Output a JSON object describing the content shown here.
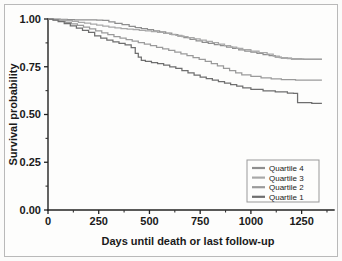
{
  "figure": {
    "background_color": "#fdfdfc",
    "frame_color": "#b9b9b9"
  },
  "chart_data": {
    "type": "line",
    "title": "",
    "subtitle": "",
    "xlabel": "Days until death or last follow-up",
    "ylabel": "Survival probability",
    "xlim": [
      0,
      1380
    ],
    "ylim": [
      0.0,
      1.0
    ],
    "xticks": [
      0,
      250,
      500,
      750,
      1000,
      1250
    ],
    "xtick_labels": [
      "0",
      "250",
      "500",
      "750",
      "1000",
      "1250"
    ],
    "xminor_ticks": [
      125,
      375,
      625,
      875,
      1125,
      1375
    ],
    "yticks": [
      0.0,
      0.25,
      0.5,
      0.75,
      1.0
    ],
    "ytick_labels": [
      "0.00",
      "0.25",
      "0.50",
      "0.75",
      "1.00"
    ],
    "yminor_ticks": [
      0.125,
      0.375,
      0.625,
      0.875
    ],
    "grid": false,
    "legend_position": "lower right",
    "legend_entries": [
      "Quartile 4",
      "Quartile 3",
      "Quartile 2",
      "Quartile 1"
    ],
    "series": [
      {
        "name": "Quartile 4",
        "color": "#8e8e8e",
        "step": "post",
        "x": [
          0,
          30,
          60,
          95,
          130,
          170,
          200,
          240,
          270,
          300,
          330,
          365,
          400,
          430,
          460,
          490,
          520,
          550,
          580,
          610,
          640,
          670,
          700,
          730,
          760,
          790,
          820,
          850,
          880,
          910,
          940,
          970,
          1000,
          1030,
          1060,
          1090,
          1120,
          1150,
          1200,
          1260,
          1350
        ],
        "y": [
          1.0,
          1.0,
          0.998,
          0.997,
          0.996,
          0.995,
          0.995,
          0.994,
          0.993,
          0.985,
          0.977,
          0.97,
          0.962,
          0.955,
          0.95,
          0.944,
          0.938,
          0.932,
          0.926,
          0.918,
          0.91,
          0.902,
          0.894,
          0.886,
          0.878,
          0.872,
          0.866,
          0.86,
          0.853,
          0.846,
          0.839,
          0.832,
          0.826,
          0.82,
          0.814,
          0.808,
          0.8,
          0.795,
          0.79,
          0.788,
          0.788
        ]
      },
      {
        "name": "Quartile 3",
        "color": "#a8a8a8",
        "step": "post",
        "x": [
          0,
          30,
          60,
          90,
          120,
          150,
          180,
          210,
          240,
          270,
          300,
          330,
          360,
          390,
          420,
          450,
          480,
          510,
          540,
          570,
          600,
          630,
          660,
          690,
          720,
          750,
          780,
          810,
          840,
          870,
          900,
          930,
          960,
          1000,
          1040,
          1080,
          1110,
          1140,
          1180,
          1250,
          1350
        ],
        "y": [
          1.0,
          0.998,
          0.996,
          0.992,
          0.988,
          0.983,
          0.978,
          0.973,
          0.968,
          0.963,
          0.958,
          0.953,
          0.95,
          0.947,
          0.944,
          0.941,
          0.938,
          0.934,
          0.93,
          0.925,
          0.92,
          0.914,
          0.908,
          0.902,
          0.896,
          0.89,
          0.883,
          0.876,
          0.868,
          0.86,
          0.853,
          0.846,
          0.84,
          0.832,
          0.824,
          0.816,
          0.806,
          0.798,
          0.792,
          0.79,
          0.79
        ]
      },
      {
        "name": "Quartile 2",
        "color": "#9a9a9a",
        "step": "post",
        "x": [
          0,
          25,
          55,
          85,
          115,
          145,
          175,
          205,
          235,
          265,
          295,
          325,
          355,
          385,
          415,
          445,
          475,
          505,
          535,
          565,
          595,
          625,
          655,
          685,
          715,
          745,
          775,
          805,
          835,
          865,
          895,
          925,
          955,
          1000,
          1050,
          1100,
          1150,
          1220,
          1280,
          1350
        ],
        "y": [
          1.0,
          0.996,
          0.99,
          0.982,
          0.974,
          0.966,
          0.957,
          0.948,
          0.938,
          0.928,
          0.918,
          0.908,
          0.9,
          0.892,
          0.884,
          0.876,
          0.868,
          0.86,
          0.852,
          0.844,
          0.836,
          0.827,
          0.818,
          0.808,
          0.798,
          0.788,
          0.778,
          0.766,
          0.754,
          0.742,
          0.73,
          0.718,
          0.708,
          0.7,
          0.692,
          0.686,
          0.682,
          0.68,
          0.68,
          0.68
        ]
      },
      {
        "name": "Quartile 1",
        "color": "#6e6e6e",
        "step": "post",
        "x": [
          0,
          25,
          50,
          80,
          110,
          140,
          170,
          200,
          230,
          260,
          290,
          320,
          350,
          380,
          410,
          430,
          445,
          460,
          480,
          510,
          540,
          570,
          600,
          630,
          660,
          690,
          720,
          750,
          780,
          810,
          840,
          870,
          900,
          930,
          960,
          1000,
          1060,
          1120,
          1180,
          1210,
          1230,
          1300,
          1350
        ],
        "y": [
          1.0,
          0.994,
          0.986,
          0.976,
          0.964,
          0.952,
          0.94,
          0.93,
          0.912,
          0.9,
          0.89,
          0.88,
          0.872,
          0.864,
          0.85,
          0.82,
          0.8,
          0.784,
          0.778,
          0.772,
          0.766,
          0.758,
          0.75,
          0.742,
          0.73,
          0.718,
          0.706,
          0.696,
          0.688,
          0.68,
          0.672,
          0.664,
          0.656,
          0.648,
          0.64,
          0.632,
          0.624,
          0.618,
          0.612,
          0.61,
          0.562,
          0.558,
          0.558
        ]
      }
    ]
  }
}
